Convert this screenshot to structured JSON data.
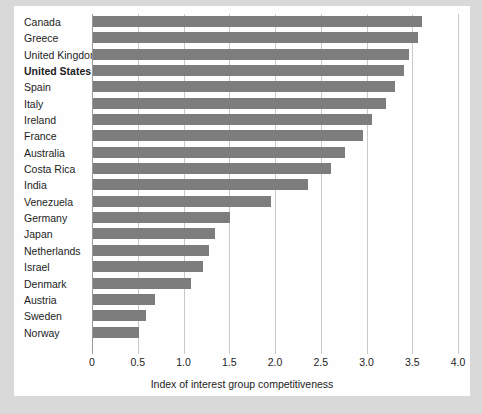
{
  "chart_data": {
    "type": "bar",
    "orientation": "horizontal",
    "title": "",
    "xlabel": "Index of interest group competitiveness",
    "ylabel": "",
    "xlim": [
      0,
      4.0
    ],
    "xticks": [
      "0",
      "0.5",
      "1.0",
      "1.5",
      "2.0",
      "2.5",
      "3.0",
      "3.5",
      "4.0"
    ],
    "xtick_values": [
      0,
      0.5,
      1.0,
      1.5,
      2.0,
      2.5,
      3.0,
      3.5,
      4.0
    ],
    "grid": true,
    "legend": null,
    "bar_color": "#7d7d7d",
    "highlight_category": "United States",
    "categories": [
      "Canada",
      "Greece",
      "United Kingdom",
      "United States",
      "Spain",
      "Italy",
      "Ireland",
      "France",
      "Australia",
      "Costa Rica",
      "India",
      "Venezuela",
      "Germany",
      "Japan",
      "Netherlands",
      "Israel",
      "Denmark",
      "Austria",
      "Sweden",
      "Norway"
    ],
    "values": [
      3.6,
      3.55,
      3.45,
      3.4,
      3.3,
      3.2,
      3.05,
      2.95,
      2.75,
      2.6,
      2.35,
      1.95,
      1.5,
      1.33,
      1.27,
      1.2,
      1.07,
      0.68,
      0.58,
      0.5
    ]
  },
  "colors": {
    "page_background": "#d9d9d9",
    "card_background": "#fefefe",
    "bar": "#7d7d7d",
    "gridline": "#c9c9c9",
    "axis": "#9a9a9a",
    "text": "#1d1d1d"
  }
}
